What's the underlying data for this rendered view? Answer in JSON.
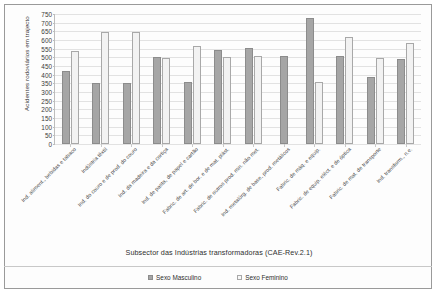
{
  "chart_data": {
    "type": "bar",
    "title": "",
    "xlabel": "Subsector das Indústrias transformadoras (CAE-Rev.2.1)",
    "ylabel": "Acidentes rodoviários em trajecto",
    "ylim": [
      0,
      750
    ],
    "ytick_step": 50,
    "yticks": [
      750,
      700,
      650,
      600,
      550,
      500,
      450,
      400,
      350,
      300,
      250,
      200,
      150,
      100,
      50,
      0
    ],
    "grid": true,
    "legend_position": "bottom",
    "categories": [
      "Ind. aliment., bebidas e tabaco",
      "Indústria têxtil",
      "Ind. do couro e de prod. do couro",
      "Ind. da madeira e da cortiça",
      "Ind. de pasta, de papel e cartão",
      "Fabric. de art. de bor. e de mat. plást.",
      "Fabric. de outros prod. min. não met.",
      "Ind. metalúrg. de base, prod. metálicos",
      "Fabric. de máq. e equip.",
      "Fabric. de equip. eléct. e de óptica",
      "Fabric. de mat. de transporte",
      "Ind. transform., n.e."
    ],
    "series": [
      {
        "name": "Sexo Masculino",
        "color": "#a6a6a6",
        "values": [
          420,
          350,
          350,
          500,
          355,
          545,
          555,
          510,
          725,
          510,
          385,
          490
        ]
      },
      {
        "name": "Sexo Feminino",
        "color": "#f2f2f2",
        "values": [
          535,
          645,
          645,
          495,
          565,
          500,
          505,
          0,
          355,
          620,
          495,
          580
        ]
      }
    ]
  },
  "legend": {
    "items": [
      {
        "label": "Sexo Masculino",
        "swatch": "masculino-swatch"
      },
      {
        "label": "Sexo Feminino",
        "swatch": "feminino-swatch"
      }
    ]
  }
}
